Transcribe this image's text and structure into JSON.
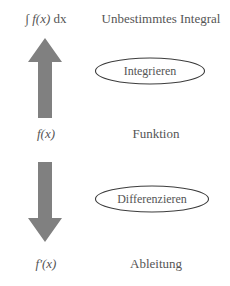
{
  "diagram": {
    "title_hidden": "",
    "rows": [
      {
        "math": "∫ f(x) dx",
        "math_parts": {
          "integral": "∫",
          "integrand": "f(x)",
          "differential": "dx"
        },
        "label": "Unbestimmtes Integral"
      },
      {
        "math": "f(x)",
        "math_parts": {
          "integral": "",
          "integrand": "f(x)",
          "differential": ""
        },
        "label": "Funktion"
      },
      {
        "math": "f′(x)",
        "math_parts": {
          "integral": "",
          "integrand": "f′(x)",
          "differential": ""
        },
        "label": "Ableitung"
      }
    ],
    "arrows": [
      {
        "name": "arrow-up",
        "direction": "up",
        "color": "#808080"
      },
      {
        "name": "arrow-down",
        "direction": "down",
        "color": "#808080"
      }
    ],
    "operations": [
      {
        "label": "Integrieren",
        "shape": "ellipse",
        "stroke": "#3d3d3d"
      },
      {
        "label": "Differenzieren",
        "shape": "ellipse",
        "stroke": "#3d3d3d"
      }
    ],
    "colors": {
      "background": "#ffffff",
      "text": "#555555",
      "arrow_fill": "#808080",
      "ellipse_stroke": "#3d3d3d"
    }
  }
}
